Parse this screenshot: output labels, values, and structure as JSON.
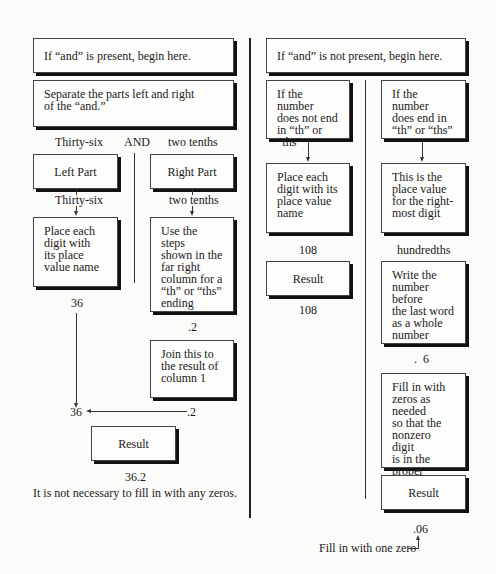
{
  "left": {
    "start_box": "If  “and” is present, begin here.",
    "separate_box": "Separate the parts left and right\nof the “and.”",
    "split_label_left": "Thirty-six",
    "split_label_and": "AND",
    "split_label_right": "two tenths",
    "left_part": {
      "title": "Left Part",
      "value_label": "Thirty-six",
      "step_box": "Place each\ndigit with\nits place\nvalue name",
      "result_value": "36"
    },
    "right_part": {
      "title": "Right Part",
      "value_label": "two tenths",
      "step_box": "Use the steps\nshown in the\nfar right\ncolumn for a\n“th” or “ths”\nending",
      "result_value": ".2",
      "join_box": "Join this to\nthe result of\ncolumn 1"
    },
    "join_left_value": "36",
    "join_right_value": ".2",
    "result_box": "Result",
    "final_value": "36.2",
    "note": "It is not necessary to fill in with any zeros."
  },
  "right": {
    "start_box": "If  “and” is not present, begin here.",
    "col1": {
      "condition_box": "If the number\ndoes not end\nin “th” or “ths”",
      "step_box": "Place each\ndigit with its\nplace value\nname",
      "value": "108",
      "result_box": "Result",
      "final_value": "108"
    },
    "col2": {
      "condition_box": "If the number\ndoes end in\n“th” or “ths”",
      "place_box": "This is the\nplace value\nfor the right-\nmost digit",
      "place_value": "hundredths",
      "write_box": "Write the\nnumber before\nthe last word\nas a whole\nnumber",
      "write_value": ".  6",
      "fill_box": "Fill in with\nzeros as needed\nso that the\nnonzero digit\nis in the proper\nplace value",
      "result_box": "Result",
      "final_value": ".06",
      "annotation": "Fill in with one zero"
    }
  }
}
